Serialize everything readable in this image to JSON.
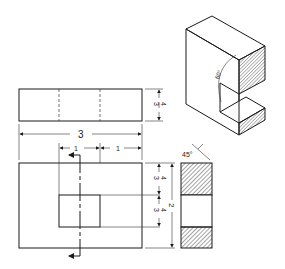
{
  "drawing": {
    "type": "orthographic-and-isometric-projection",
    "views": [
      "top-view",
      "front-view",
      "right-side-section-view",
      "isometric-view"
    ],
    "top_view": {
      "height_dim_num": "3",
      "height_dim_den": "4"
    },
    "overall_width": {
      "label": "3"
    },
    "slot_dims": {
      "left_label": "1",
      "right_label": "1"
    },
    "front_view": {
      "upper_dim_num": "3",
      "upper_dim_den": "4",
      "lower_dim_num": "3",
      "lower_dim_den": "4",
      "overall_height_label": "2"
    },
    "section_view": {
      "hatch_angle_label": "45°"
    },
    "isometric_view": {
      "angle_label": "60°"
    },
    "colors": {
      "line": "#1a1a1a",
      "background": "#ffffff"
    }
  }
}
